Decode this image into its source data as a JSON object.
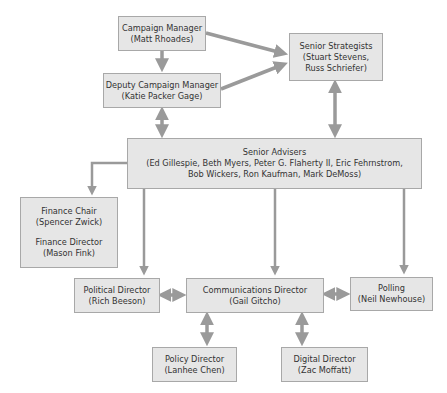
{
  "nodes": {
    "campaign_manager": {
      "title": "Campaign Manager",
      "people": "(Matt Rhoades)"
    },
    "senior_strategists": {
      "title": "Senior Strategists",
      "people_line1": "(Stuart Stevens,",
      "people_line2": "Russ Schriefer)"
    },
    "deputy_campaign_manager": {
      "title": "Deputy Campaign Manager",
      "people": "(Katie Packer Gage)"
    },
    "senior_advisers": {
      "title": "Senior Advisers",
      "people_line1": "(Ed Gillespie, Beth Myers, Peter G. Flaherty II, Eric Fehrnstrom,",
      "people_line2": "Bob Wickers, Ron Kaufman, Mark DeMoss)"
    },
    "finance": {
      "chair_title": "Finance Chair",
      "chair_person": "(Spencer Zwick)",
      "director_title": "Finance Director",
      "director_person": "(Mason Fink)"
    },
    "political_director": {
      "title": "Political Director",
      "people": "(Rich Beeson)"
    },
    "communications_director": {
      "title": "Communications Director",
      "people": "(Gail Gitcho)"
    },
    "polling": {
      "title": "Polling",
      "people": "(Neil Newhouse)"
    },
    "policy_director": {
      "title": "Policy Director",
      "people": "(Lanhee Chen)"
    },
    "digital_director": {
      "title": "Digital Director",
      "people": "(Zac Moffatt)"
    }
  },
  "colors": {
    "box_fill": "#e6e6e6",
    "box_border": "#a8a8a8",
    "arrow": "#9a9a9a",
    "text": "#333333"
  }
}
